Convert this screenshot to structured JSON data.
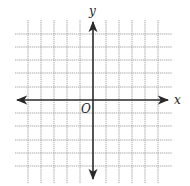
{
  "diagram": {
    "type": "coordinate-plane",
    "labels": {
      "x_axis": "x",
      "y_axis": "y",
      "origin": "O"
    },
    "grid": {
      "columns": 11,
      "rows": 11,
      "line_style": "dotted",
      "line_color": "#9a9a9a"
    },
    "axes_color": "#2a2a2a"
  }
}
